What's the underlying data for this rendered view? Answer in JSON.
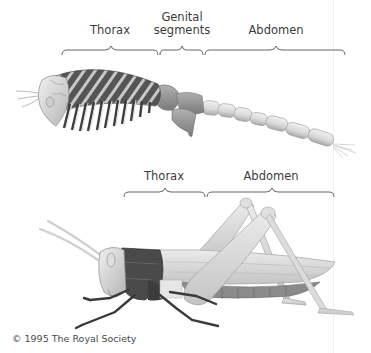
{
  "diagram": {
    "top_figure": {
      "subject": "segmented-arthropod-ancestor",
      "labels": [
        {
          "text": "Thorax",
          "x": 110,
          "y": 30
        },
        {
          "text": "Genital\nsegments",
          "line1": "Genital",
          "line2": "segments",
          "x": 182,
          "y": 17
        },
        {
          "text": "Abdomen",
          "x": 276,
          "y": 30
        }
      ],
      "brackets": [
        {
          "name": "thorax",
          "x1": 62,
          "x2": 158,
          "y": 50
        },
        {
          "name": "genital-segments",
          "x1": 160,
          "x2": 203,
          "y": 50
        },
        {
          "name": "abdomen",
          "x1": 205,
          "x2": 345,
          "y": 50
        }
      ]
    },
    "bottom_figure": {
      "subject": "grasshopper",
      "labels": [
        {
          "text": "Thorax",
          "x": 164,
          "y": 176
        },
        {
          "text": "Abdomen",
          "x": 271,
          "y": 176
        }
      ],
      "brackets": [
        {
          "name": "thorax",
          "x1": 124,
          "x2": 205,
          "y": 192
        },
        {
          "name": "abdomen",
          "x1": 207,
          "x2": 334,
          "y": 192
        }
      ]
    },
    "copyright": "© 1995 The Royal Society"
  },
  "colors": {
    "background": "#ffffff",
    "label_text": "#3c3c3c",
    "bracket": "#555555",
    "dark_segment": "#4a4a4a",
    "mid_gray": "#8c8c8c",
    "light_gray": "#d9d9d9"
  }
}
